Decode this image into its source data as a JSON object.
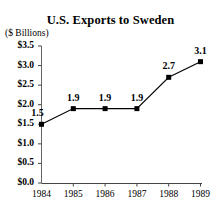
{
  "chart_data": {
    "type": "line",
    "title": "U.S. Exports to Sweden",
    "subtitle": "($ Billions)",
    "xlabel": "",
    "ylabel": "($ Billions)",
    "categories": [
      "1984",
      "1985",
      "1986",
      "1987",
      "1988",
      "1989"
    ],
    "values": [
      1.5,
      1.9,
      1.9,
      1.9,
      2.7,
      3.1
    ],
    "point_labels": [
      "1.5",
      "1.9",
      "1.9",
      "1.9",
      "2.7",
      "3.1"
    ],
    "ylim": [
      0.0,
      3.5
    ],
    "ytick_values": [
      0.0,
      0.5,
      1.0,
      1.5,
      2.0,
      2.5,
      3.0,
      3.5
    ],
    "ytick_labels": [
      "$0.0",
      "$0.5",
      "$1.0",
      "$1.5",
      "$2.0",
      "$2.5",
      "$3.0",
      "$3.5"
    ],
    "grid": false,
    "legend": false,
    "marker": "square",
    "series_color": "#000000",
    "axis_color": "#555555",
    "background": "#ffffff"
  }
}
